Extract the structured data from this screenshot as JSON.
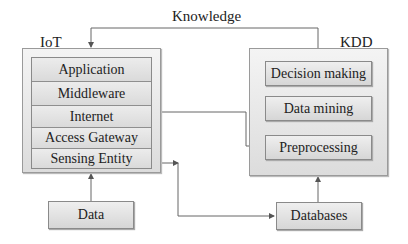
{
  "diagram": {
    "feedback_label": "Knowledge",
    "iot": {
      "title": "IoT",
      "layers": [
        "Application",
        "Middleware",
        "Internet",
        "Access Gateway",
        "Sensing Entity"
      ]
    },
    "kdd": {
      "title": "KDD",
      "steps": [
        "Decision making",
        "Data mining",
        "Preprocessing"
      ]
    },
    "inputs": {
      "data": "Data",
      "databases": "Databases"
    },
    "edges": [
      {
        "from": "Data",
        "to": "Sensing Entity"
      },
      {
        "from": "Sensing Entity",
        "to": "Databases"
      },
      {
        "from": "Internet",
        "to": "Preprocessing"
      },
      {
        "from": "Databases",
        "to": "KDD"
      },
      {
        "from": "KDD",
        "to": "IoT",
        "label": "Knowledge"
      }
    ]
  }
}
